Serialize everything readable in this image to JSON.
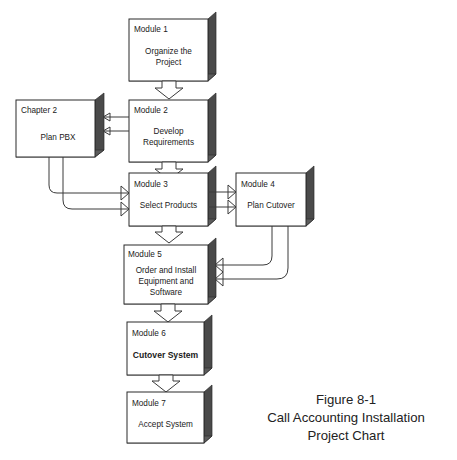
{
  "figure": {
    "caption_lines": [
      "Figure 8-1",
      "Call Accounting Installation",
      "Project Chart"
    ]
  },
  "colors": {
    "background": "#ffffff",
    "box_fill": "#ffffff",
    "box_border": "#2b2b2b",
    "shadow_side": "#4a4a4a",
    "shadow_bottom": "#5c5c5c",
    "arrow_stroke": "#3a3a3a",
    "text": "#1a1a1a"
  },
  "nodes": [
    {
      "id": "module-1",
      "title": "Module 1",
      "body": [
        "Organize the",
        "Project"
      ],
      "bold": false
    },
    {
      "id": "chapter-2",
      "title": "Chapter 2",
      "body": [
        "Plan PBX"
      ],
      "bold": false
    },
    {
      "id": "module-2",
      "title": "Module 2",
      "body": [
        "Develop",
        "Requirements"
      ],
      "bold": false
    },
    {
      "id": "module-3",
      "title": "Module 3",
      "body": [
        "Select  Products"
      ],
      "bold": false
    },
    {
      "id": "module-4",
      "title": "Module 4",
      "body": [
        "Plan Cutover"
      ],
      "bold": false
    },
    {
      "id": "module-5",
      "title": "Module 5",
      "body": [
        "Order and Install",
        "Equipment and",
        "Software"
      ],
      "bold": false
    },
    {
      "id": "module-6",
      "title": "Module 6",
      "body": [
        "Cutover System"
      ],
      "bold": true
    },
    {
      "id": "module-7",
      "title": "Module 7",
      "body": [
        "Accept System"
      ],
      "bold": false
    }
  ],
  "connectors": [
    {
      "id": "m1-to-m2",
      "from": "module-1",
      "to": "module-2",
      "style": "block-arrow-down"
    },
    {
      "id": "m2-to-ch2-upper",
      "from": "module-2",
      "to": "chapter-2",
      "style": "line-arrow-left"
    },
    {
      "id": "m2-to-ch2-lower",
      "from": "module-2",
      "to": "chapter-2",
      "style": "line-arrow-left"
    },
    {
      "id": "m2-to-m3",
      "from": "module-2",
      "to": "module-3",
      "style": "block-arrow-down"
    },
    {
      "id": "ch2-to-m3-upper",
      "from": "chapter-2",
      "to": "module-3",
      "style": "curve-arrow-right"
    },
    {
      "id": "ch2-to-m3-lower",
      "from": "chapter-2",
      "to": "module-3",
      "style": "curve-arrow-right"
    },
    {
      "id": "m3-to-m4-upper",
      "from": "module-3",
      "to": "module-4",
      "style": "line-arrow-right"
    },
    {
      "id": "m3-to-m4-lower",
      "from": "module-3",
      "to": "module-4",
      "style": "line-arrow-right"
    },
    {
      "id": "m3-to-m5",
      "from": "module-3",
      "to": "module-5",
      "style": "block-arrow-down"
    },
    {
      "id": "m3-right-to-m5",
      "from": "module-3",
      "to": "module-5",
      "style": "curve-arrow-left"
    },
    {
      "id": "m4-to-m5",
      "from": "module-4",
      "to": "module-5",
      "style": "curve-arrow-left"
    },
    {
      "id": "m5-to-m6",
      "from": "module-5",
      "to": "module-6",
      "style": "block-arrow-down"
    },
    {
      "id": "m6-to-m7",
      "from": "module-6",
      "to": "module-7",
      "style": "block-arrow-down"
    }
  ]
}
